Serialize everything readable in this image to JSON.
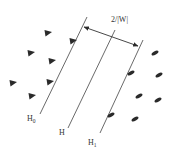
{
  "diagram": {
    "colors": {
      "line": "#444444",
      "marker": "#2a2a2a",
      "text": "#333333"
    },
    "margin_label": "2/|W|",
    "hyperplanes": [
      {
        "id": "H0",
        "label_main": "H",
        "label_sub": "0",
        "x1": 87,
        "y1": 17,
        "x2": 40,
        "y2": 114,
        "lx": 27,
        "ly": 121
      },
      {
        "id": "H",
        "label_main": "H",
        "label_sub": "",
        "x1": 115,
        "y1": 30,
        "x2": 68,
        "y2": 128,
        "lx": 59,
        "ly": 135
      },
      {
        "id": "H1",
        "label_main": "H",
        "label_sub": "1",
        "x1": 143,
        "y1": 40,
        "x2": 100,
        "y2": 133,
        "lx": 88,
        "ly": 145
      }
    ],
    "margin_arrow": {
      "x1": 84,
      "y1": 27,
      "x2": 138,
      "y2": 46
    },
    "class_a_markers": {
      "shape": "triangle",
      "points": [
        [
          48,
          33
        ],
        [
          73,
          41
        ],
        [
          31,
          53
        ],
        [
          52,
          61
        ],
        [
          13,
          83
        ],
        [
          50,
          82
        ],
        [
          32,
          96
        ]
      ]
    },
    "class_b_markers": {
      "shape": "ellipse",
      "points": [
        [
          155,
          53
        ],
        [
          159,
          75
        ],
        [
          131,
          73
        ],
        [
          139,
          96
        ],
        [
          158,
          100
        ],
        [
          111,
          115
        ],
        [
          135,
          119
        ]
      ]
    }
  }
}
